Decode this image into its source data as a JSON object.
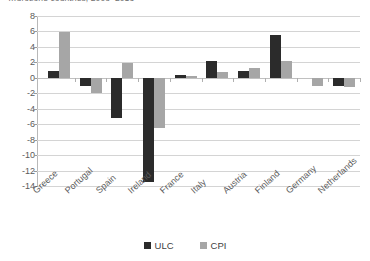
{
  "chart_data": {
    "type": "bar",
    "title": "…urozone countries, 2008–2013",
    "xlabel": "",
    "ylabel": "",
    "ylim": [
      -14,
      8
    ],
    "yticks": [
      8,
      6,
      4,
      2,
      0,
      -2,
      -4,
      -6,
      -8,
      -10,
      -12,
      -14
    ],
    "ytick_labels": [
      "8",
      "6",
      "4",
      "2",
      "0",
      "-2",
      "-4",
      "-6",
      "-8",
      "-10",
      "-12",
      "-14"
    ],
    "grid": true,
    "legend_position": "bottom",
    "categories": [
      "Greece",
      "Portugal",
      "Spain",
      "Ireland",
      "France",
      "Italy",
      "Austria",
      "Finland",
      "Germany",
      "Netherlands"
    ],
    "series": [
      {
        "name": "ULC",
        "color": "#2b2b2b",
        "values": [
          0.9,
          -1.1,
          -5.2,
          -13.5,
          0.4,
          2.2,
          0.9,
          5.5,
          0.0,
          -1.0
        ]
      },
      {
        "name": "CPI",
        "color": "#a6a6a6",
        "values": [
          5.9,
          -2.0,
          1.9,
          -6.5,
          0.3,
          0.7,
          1.3,
          2.2,
          -1.0,
          -1.2
        ]
      }
    ]
  },
  "legend": {
    "items": [
      {
        "label": "ULC",
        "color": "#2b2b2b"
      },
      {
        "label": "CPI",
        "color": "#a6a6a6"
      }
    ]
  }
}
